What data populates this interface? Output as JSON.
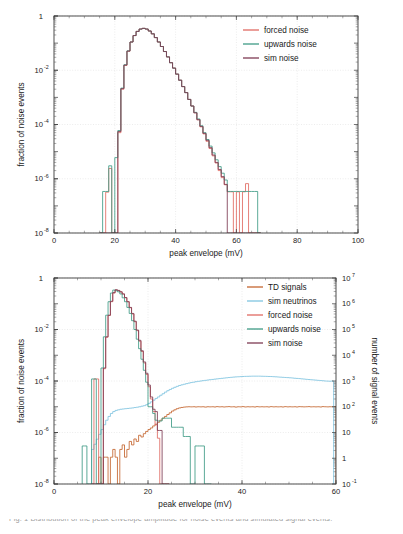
{
  "figure": {
    "name": "noise-and-signal-peak-envelope-distributions",
    "background": "#ffffff",
    "caption_fragment": "Fig. 1  Distribution of the peak envelope amplitude for noise events and simulated signal events."
  },
  "colors": {
    "forced_noise": "#e06a62",
    "upwards_noise": "#3f9b85",
    "sim_noise": "#7d3a52",
    "td_signals": "#c4652f",
    "sim_neutrinos": "#7fc4e0",
    "frame": "#3a3a3a",
    "grid": "#d8d8d8",
    "text": "#1a1a1a"
  },
  "chart_data": [
    {
      "id": "top",
      "type": "line",
      "title": "",
      "xlabel": "peak envelope (mV)",
      "ylabel": "fraction of noise events",
      "y2label": "",
      "xlim": [
        0,
        100
      ],
      "ylim": [
        1e-08,
        1
      ],
      "yscale": "log",
      "grid": true,
      "legend_position": "top-right",
      "xticks": [
        0,
        20,
        40,
        60,
        80,
        100
      ],
      "xticklabels": [
        "0",
        "20",
        "40",
        "60",
        "80",
        "100"
      ],
      "yticks": [
        1,
        0.01,
        0.0001,
        1e-06,
        1e-08
      ],
      "yticklabels": [
        "1",
        "10",
        "10",
        "10",
        "10"
      ],
      "ytick_exponents": [
        "",
        "-2",
        "-4",
        "-6",
        "-8"
      ],
      "bin_width": 1,
      "series": [
        {
          "name": "forced noise",
          "color_key": "forced_noise",
          "x_start": 15,
          "values": [
            1e-08,
            1e-08,
            3.2e-07,
            2.4e-06,
            1e-08,
            1e-08,
            5e-05,
            0.002,
            0.015,
            0.05,
            0.11,
            0.19,
            0.27,
            0.33,
            0.35,
            0.33,
            0.28,
            0.22,
            0.16,
            0.11,
            0.075,
            0.049,
            0.031,
            0.019,
            0.012,
            0.0072,
            0.0043,
            0.0025,
            0.0015,
            0.00084,
            0.00048,
            0.00027,
            0.00015,
            8.2e-05,
            4.5e-05,
            2.4e-05,
            1.3e-05,
            7e-06,
            3.8e-06,
            2e-06,
            1.1e-06,
            6e-07,
            3.3e-07,
            3.3e-07,
            1e-08,
            3.3e-07,
            1e-08,
            3.3e-07,
            6.6e-07,
            1e-08,
            1e-08,
            1e-08,
            1e-08
          ]
        },
        {
          "name": "upwards noise",
          "color_key": "upwards_noise",
          "x_start": 15,
          "values": [
            1e-08,
            3.4e-07,
            3.4e-07,
            3e-06,
            1e-08,
            6e-06,
            6e-05,
            0.0022,
            0.016,
            0.052,
            0.11,
            0.19,
            0.27,
            0.33,
            0.35,
            0.33,
            0.28,
            0.22,
            0.16,
            0.11,
            0.075,
            0.049,
            0.031,
            0.019,
            0.012,
            0.0072,
            0.0043,
            0.0025,
            0.0015,
            0.00084,
            0.00048,
            0.00028,
            0.00016,
            9e-05,
            5e-05,
            2.8e-05,
            1.6e-05,
            9e-06,
            5e-06,
            2.8e-06,
            1.6e-06,
            9e-07,
            3.4e-07,
            3.4e-07,
            3.4e-07,
            3.4e-07,
            3.4e-07,
            3.4e-07,
            3.4e-07,
            3.4e-07,
            3.4e-07,
            3.4e-07,
            1e-08
          ]
        },
        {
          "name": "sim noise",
          "color_key": "sim_noise",
          "x_start": 15,
          "values": [
            1e-08,
            1e-08,
            1e-08,
            1e-08,
            1e-08,
            1e-08,
            5.5e-05,
            0.0021,
            0.0155,
            0.051,
            0.11,
            0.19,
            0.27,
            0.33,
            0.35,
            0.33,
            0.28,
            0.22,
            0.16,
            0.11,
            0.075,
            0.049,
            0.031,
            0.019,
            0.012,
            0.0072,
            0.0043,
            0.0025,
            0.0015,
            0.00084,
            0.00048,
            0.00027,
            0.00015,
            8.5e-05,
            4.7e-05,
            2.6e-05,
            1.4e-05,
            7.5e-06,
            4e-06,
            2.2e-06,
            1.2e-06,
            6.2e-07,
            1e-08,
            1e-08,
            1e-08,
            1e-08,
            1e-08,
            1e-08,
            1e-08,
            1e-08,
            1e-08,
            1e-08,
            1e-08
          ]
        }
      ]
    },
    {
      "id": "bottom",
      "type": "line",
      "title": "",
      "xlabel": "peak envelope (mV)",
      "ylabel": "fraction of noise events",
      "y2label": "number of signal events",
      "xlim": [
        0,
        60
      ],
      "ylim": [
        1e-08,
        1
      ],
      "y2lim": [
        0.1,
        10000000
      ],
      "yscale": "log",
      "grid": true,
      "legend_position": "top-right",
      "xticks": [
        0,
        20,
        40,
        60
      ],
      "xticklabels": [
        "0",
        "20",
        "40",
        "60"
      ],
      "yticks": [
        1,
        0.01,
        0.0001,
        1e-06,
        1e-08
      ],
      "yticklabels": [
        "1",
        "10",
        "10",
        "10",
        "10"
      ],
      "ytick_exponents": [
        "",
        "-2",
        "-4",
        "-6",
        "-8"
      ],
      "y2ticks": [
        10000000,
        1000000,
        100000,
        10000,
        1000,
        100,
        10,
        1,
        0.1
      ],
      "y2ticklabels": [
        "10",
        "10",
        "10",
        "10",
        "10",
        "10",
        "10",
        "1",
        "10"
      ],
      "y2tick_exponents": [
        "7",
        "6",
        "5",
        "4",
        "3",
        "2",
        "",
        "",
        "-1"
      ],
      "bin_width": 0.5,
      "series": [
        {
          "name": "TD signals",
          "color_key": "td_signals",
          "x_start": 9,
          "values": [
            1e-08,
            1.1e-07,
            1e-08,
            1.1e-07,
            1.1e-07,
            1e-08,
            1.1e-07,
            2.2e-07,
            1.1e-07,
            1e-08,
            2.2e-07,
            3.3e-07,
            1.1e-07,
            2.2e-07,
            4.5e-07,
            3.3e-07,
            5.6e-07,
            4.5e-07,
            7.8e-07,
            6.7e-07,
            9e-07,
            1.1e-06,
            1.3e-06,
            1.5e-06,
            1.8e-06,
            2.1e-06,
            2.5e-06,
            3e-06,
            3.6e-06,
            4.2e-06,
            5e-06,
            5.8e-06,
            6.8e-06,
            7.6e-06,
            8.4e-06,
            9e-06,
            9.4e-06,
            9.7e-06,
            9.9e-06,
            1e-05,
            9.9e-06,
            1e-05,
            9.8e-06,
            1e-05,
            9.9e-06,
            1e-05,
            9.7e-06,
            1e-05,
            9.9e-06,
            1e-05,
            9.8e-06,
            1.01e-05,
            9.9e-06,
            1e-05,
            9.8e-06,
            1e-05,
            1.01e-05,
            9.9e-06,
            1e-05,
            9.7e-06,
            1e-05,
            9.9e-06,
            1.01e-05,
            9.8e-06,
            1e-05,
            9.9e-06,
            1e-05,
            9.8e-06,
            1.01e-05,
            9.9e-06,
            1e-05,
            9.9e-06,
            1e-05,
            9.8e-06,
            1.01e-05,
            9.9e-06,
            1e-05,
            9.9e-06,
            1e-05,
            9.8e-06,
            1.01e-05,
            9.9e-06,
            1e-05,
            9.9e-06,
            1e-05,
            9.8e-06,
            1.01e-05,
            1e-05,
            9.9e-06,
            1e-05,
            1.01e-05,
            9.9e-06,
            1e-05,
            9.9e-06,
            1e-05,
            9.8e-06,
            1.01e-05,
            1e-05,
            9.9e-06,
            1e-05,
            1e-05,
            1.01e-05
          ]
        },
        {
          "name": "sim neutrinos",
          "color_key": "sim_neutrinos",
          "x_start": 8,
          "values": [
            2.2e-07,
            3.5e-07,
            5.5e-07,
            8.5e-07,
            1.3e-06,
            2e-06,
            3e-06,
            4.2e-06,
            5.5e-06,
            6.5e-06,
            7.2e-06,
            7.6e-06,
            8e-06,
            8.2e-06,
            8.4e-06,
            8.6e-06,
            8.8e-06,
            9e-06,
            9.3e-06,
            9.6e-06,
            1e-05,
            1.05e-05,
            1.1e-05,
            1.2e-05,
            1.35e-05,
            1.55e-05,
            1.8e-05,
            2.1e-05,
            2.4e-05,
            2.8e-05,
            3.2e-05,
            3.7e-05,
            4.2e-05,
            4.7e-05,
            5.2e-05,
            5.7e-05,
            6.2e-05,
            6.7e-05,
            7.1e-05,
            7.5e-05,
            7.9e-05,
            8.3e-05,
            8.7e-05,
            9e-05,
            9.4e-05,
            9.7e-05,
            0.0001,
            0.000103,
            0.000106,
            0.000109,
            0.000112,
            0.000115,
            0.000118,
            0.000121,
            0.000124,
            0.000127,
            0.00013,
            0.000133,
            0.000136,
            0.000139,
            0.000142,
            0.000144,
            0.000146,
            0.000148,
            0.00015,
            0.000151,
            0.000152,
            0.000153,
            0.000154,
            0.000154,
            0.000154,
            0.000154,
            0.000153,
            0.000152,
            0.000151,
            0.00015,
            0.000149,
            0.000147,
            0.000145,
            0.000143,
            0.000141,
            0.000139,
            0.000137,
            0.000135,
            0.000133,
            0.000131,
            0.000128,
            0.000126,
            0.000124,
            0.000121,
            0.000119,
            0.000116,
            0.000114,
            0.000112,
            0.00011,
            0.000108,
            0.000106,
            0.000104,
            0.000102,
            0.0001,
            9.9e-05,
            9.8e-05,
            0.0001
          ]
        },
        {
          "name": "forced noise",
          "color_key": "forced_noise",
          "x_start": 8,
          "values": [
            1e-08,
            0.00012,
            0.00012,
            1e-08,
            1e-08,
            0.0003,
            0.005,
            0.035,
            0.12,
            0.26,
            0.34,
            0.32,
            0.29,
            0.24,
            0.17,
            0.12,
            0.07,
            0.04,
            0.02,
            0.009,
            0.0035,
            0.0014,
            0.0005,
            0.00018,
            6e-05,
            2e-05,
            6.5e-06,
            2e-06,
            6e-07,
            1e-08,
            1e-08,
            1e-08,
            1e-08
          ]
        },
        {
          "name": "upwards noise",
          "color_key": "upwards_noise",
          "x_start": 6,
          "values": [
            3e-07,
            3e-07,
            1e-08,
            1e-08,
            0.00012,
            0.00012,
            1e-08,
            1e-08,
            0.00032,
            0.0052,
            0.036,
            0.12,
            0.26,
            0.34,
            0.32,
            0.29,
            0.24,
            0.17,
            0.12,
            0.072,
            0.042,
            0.022,
            0.01,
            0.0042,
            0.0018,
            0.0007,
            0.00026,
            9e-05,
            1e-05,
            1e-05,
            5.5e-06,
            3e-06,
            2.8e-06,
            2.8e-06,
            3.6e-06,
            3.6e-06,
            3.6e-06,
            3.6e-06,
            1.6e-06,
            1.6e-06,
            1.6e-06,
            1.6e-06,
            1.6e-06,
            7e-07,
            7e-07,
            7e-07,
            1e-08,
            1e-08,
            3e-07,
            3e-07,
            3e-07,
            3e-07,
            1e-08,
            1e-08,
            1e-08
          ]
        },
        {
          "name": "sim noise",
          "color_key": "sim_noise",
          "x_start": 8,
          "values": [
            1e-08,
            1e-08,
            1e-08,
            1e-08,
            1e-08,
            0.00032,
            0.0052,
            0.036,
            0.125,
            0.27,
            0.35,
            0.33,
            0.29,
            0.24,
            0.175,
            0.12,
            0.072,
            0.042,
            0.021,
            0.0095,
            0.0038,
            0.0015,
            0.00055,
            0.0002,
            7e-05,
            2.4e-05,
            8e-06,
            6.5e-06,
            1.2e-06,
            1.2e-06,
            1e-08,
            1e-08,
            1e-08
          ]
        }
      ]
    }
  ]
}
